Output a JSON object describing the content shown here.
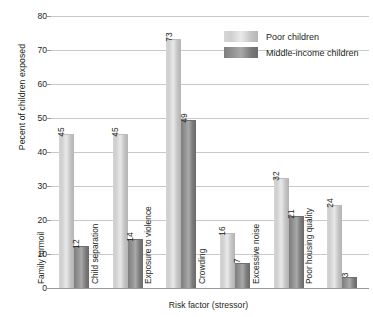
{
  "chart_data": {
    "type": "bar",
    "title": "",
    "xlabel": "Risk factor (stressor)",
    "ylabel": "Pecent of children exposed",
    "ylim": [
      0,
      80
    ],
    "ystep": 10,
    "yticks": [
      0,
      10,
      20,
      30,
      40,
      50,
      60,
      70,
      80
    ],
    "grid": true,
    "legend_position": "top-right",
    "categories": [
      "Family turmoil",
      "Child separation",
      "Exposure to violence",
      "Crowding",
      "Excessive noise",
      "Poor housing quality"
    ],
    "series": [
      {
        "name": "Poor children",
        "color": "#d5d5d5",
        "values": [
          45,
          45,
          73,
          16,
          32,
          24
        ]
      },
      {
        "name": "Middle-income children",
        "color": "#8a8a8a",
        "values": [
          12,
          14,
          49,
          7,
          21,
          3
        ]
      }
    ]
  }
}
